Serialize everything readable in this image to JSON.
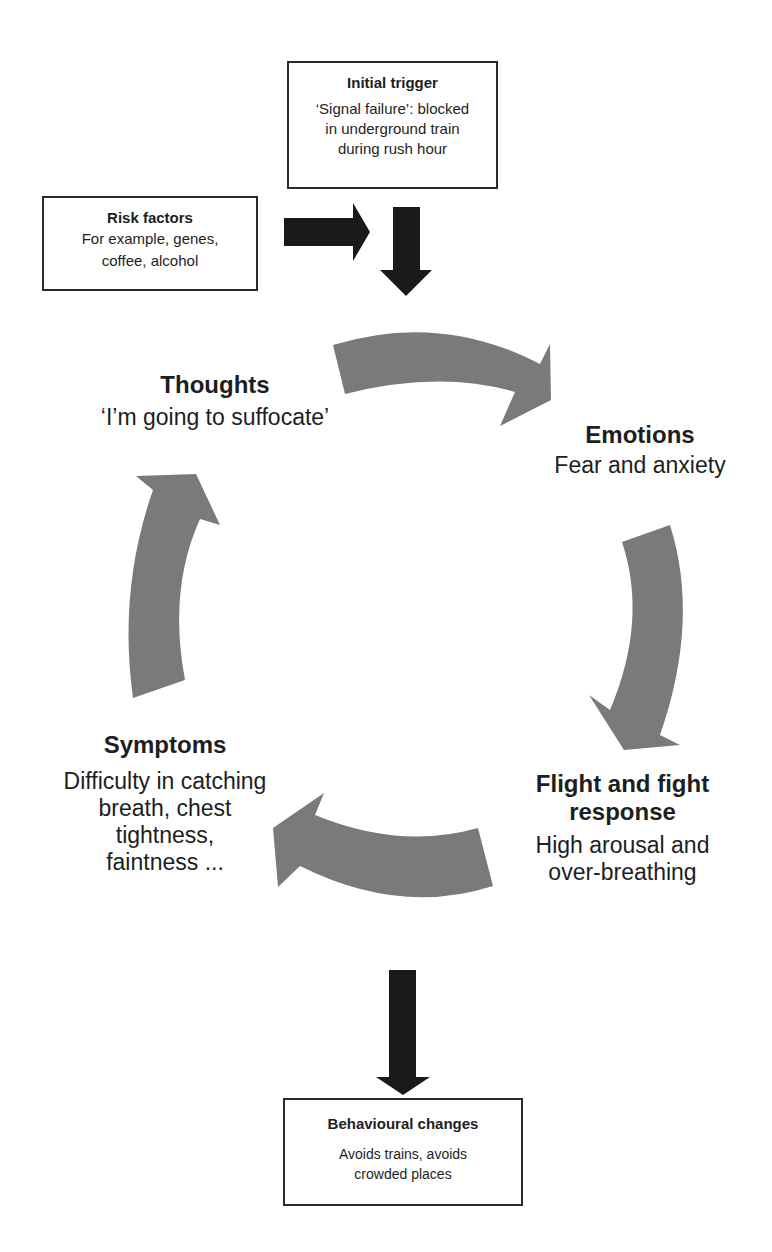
{
  "diagram": {
    "type": "vicious-cycle",
    "colors": {
      "cycle_arrow": "#7a7a7a",
      "flow_arrow": "#1a1a1a",
      "box_border": "#2a2a2a",
      "text": "#1e1e1e"
    },
    "initial_trigger": {
      "title": "Initial trigger",
      "lines": [
        "‘Signal failure’: blocked",
        "in underground train",
        "during rush hour"
      ]
    },
    "risk_factors": {
      "title": "Risk factors",
      "lines": [
        "For example, genes,",
        "coffee, alcohol"
      ]
    },
    "cycle": [
      {
        "id": "thoughts",
        "title": "Thoughts",
        "lines": [
          "‘I’m going to suffocate’"
        ]
      },
      {
        "id": "emotions",
        "title": "Emotions",
        "lines": [
          "Fear and anxiety"
        ]
      },
      {
        "id": "flight-fight",
        "title_lines": [
          "Flight and fight",
          "response"
        ],
        "lines": [
          "High arousal and",
          "over-breathing"
        ]
      },
      {
        "id": "symptoms",
        "title": "Symptoms",
        "lines": [
          "Difficulty in catching",
          "breath, chest",
          "tightness,",
          "faintness ..."
        ]
      }
    ],
    "behavioural_changes": {
      "title": "Behavioural changes",
      "lines": [
        "Avoids trains, avoids",
        "crowded places"
      ]
    },
    "edges": [
      {
        "from": "risk-factors",
        "to": "trigger-flow",
        "style": "solid-black"
      },
      {
        "from": "initial-trigger",
        "to": "cycle",
        "style": "solid-black"
      },
      {
        "from": "thoughts",
        "to": "emotions",
        "style": "curved-grey"
      },
      {
        "from": "emotions",
        "to": "flight-fight",
        "style": "curved-grey"
      },
      {
        "from": "flight-fight",
        "to": "symptoms",
        "style": "curved-grey"
      },
      {
        "from": "symptoms",
        "to": "thoughts",
        "style": "curved-grey"
      },
      {
        "from": "cycle",
        "to": "behavioural-changes",
        "style": "solid-black"
      }
    ]
  }
}
